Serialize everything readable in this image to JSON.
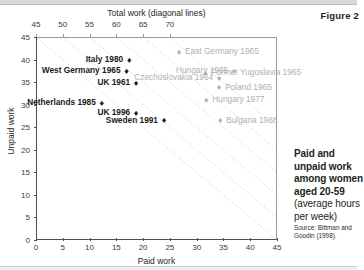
{
  "figure": {
    "label": "Figure 2"
  },
  "caption": {
    "title": "Paid and unpaid work among women aged 20-59",
    "subtitle": "(average hours per week)",
    "source": "Source: Bittman and Goodin (1998)."
  },
  "chart_data": {
    "type": "scatter",
    "title": "Paid and unpaid work among women aged 20-59",
    "xlabel": "Paid work",
    "ylabel": "Unpaid work",
    "top_axis_label": "Total work (diagonal lines)",
    "xlim": [
      0,
      45
    ],
    "ylim": [
      0,
      45
    ],
    "xticks": [
      0,
      5,
      10,
      15,
      20,
      25,
      30,
      35,
      40,
      45
    ],
    "yticks": [
      0,
      5,
      10,
      15,
      20,
      25,
      30,
      35,
      40,
      45
    ],
    "top_ticks": [
      45,
      50,
      55,
      60,
      65,
      70
    ],
    "grid": false,
    "diagonal_lines": {
      "label": "Total work (diagonal lines)",
      "values": [
        45,
        50,
        55,
        60,
        65,
        70
      ],
      "style": "dotted",
      "color": "#d2d2d2"
    },
    "legend": "none",
    "series": [
      {
        "name": "Western countries",
        "color": "#1a1a1a",
        "points": [
          {
            "label": "Italy 1980",
            "x": 17.4,
            "y": 39.9,
            "label_side": "left"
          },
          {
            "label": "West Germany 1965",
            "x": 16.9,
            "y": 37.4,
            "label_side": "left"
          },
          {
            "label": "UK 1961",
            "x": 18.7,
            "y": 34.8,
            "label_side": "left"
          },
          {
            "label": "Netherlands 1985",
            "x": 12.3,
            "y": 30.3,
            "label_side": "left"
          },
          {
            "label": "UK 1996",
            "x": 18.7,
            "y": 28.1,
            "label_side": "left"
          },
          {
            "label": "Sweden 1991",
            "x": 23.9,
            "y": 26.4,
            "label_side": "left"
          }
        ]
      },
      {
        "name": "Eastern countries",
        "color": "#b0b0b0",
        "points": [
          {
            "label": "East Germany 1965",
            "x": 26.7,
            "y": 41.6,
            "label_side": "right"
          },
          {
            "label": "Former Yugoslavia 1965",
            "x": 31.6,
            "y": 37.0,
            "label_side": "right"
          },
          {
            "label": "Czechoslovakia 1964",
            "x": 34.2,
            "y": 35.9,
            "label_side": "left"
          },
          {
            "label": "Hungary 1965",
            "x": 37.0,
            "y": 37.4,
            "label_side": "left"
          },
          {
            "label": "Poland 1965",
            "x": 34.2,
            "y": 33.7,
            "label_side": "right"
          },
          {
            "label": "Hungary 1977",
            "x": 31.8,
            "y": 31.0,
            "label_side": "right"
          },
          {
            "label": "Bulgaria 1988",
            "x": 34.4,
            "y": 26.4,
            "label_side": "right"
          }
        ]
      }
    ]
  }
}
